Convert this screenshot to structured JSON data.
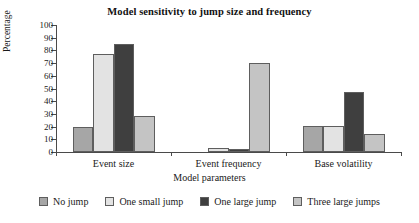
{
  "chart_data": {
    "type": "bar",
    "title": "Model sensitivity to jump size and frequency",
    "xlabel": "Model parameters",
    "ylabel": "Percentage",
    "categories": [
      "Event size",
      "Event frequency",
      "Base volatility"
    ],
    "series": [
      {
        "name": "No jump",
        "color": "#a6a6a6",
        "values": [
          20,
          0,
          20.5
        ]
      },
      {
        "name": "One small jump",
        "color": "#e3e3e3",
        "values": [
          77,
          3,
          20.5
        ]
      },
      {
        "name": "One large jump",
        "color": "#3f3f3f",
        "values": [
          85,
          2,
          47
        ]
      },
      {
        "name": "Three large jumps",
        "color": "#c4c4c4",
        "values": [
          28.5,
          70,
          14
        ]
      }
    ],
    "ylim": [
      0,
      100
    ],
    "yticks": [
      0,
      10,
      20,
      30,
      40,
      50,
      60,
      70,
      80,
      90,
      100
    ],
    "ytick_labels": [
      "0",
      "10",
      "20",
      "30",
      "40",
      "50",
      "60",
      "70",
      "80",
      "90",
      "100"
    ],
    "grid": false,
    "legend_position": "bottom",
    "bar_edge_color": "#5e5e5e",
    "axis_color": "#4a4a4a"
  }
}
